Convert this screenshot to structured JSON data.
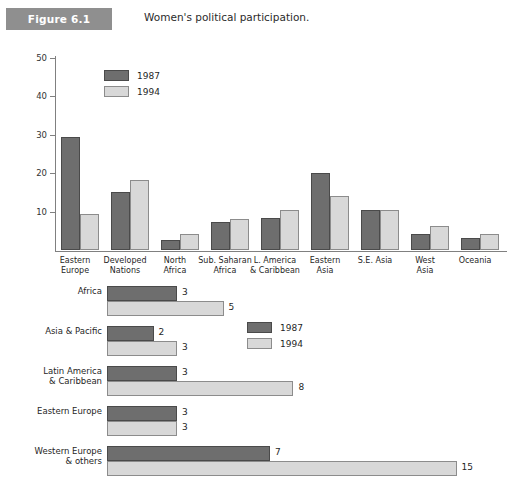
{
  "figure": {
    "badge": "Figure 6.1",
    "title": "Women's political participation."
  },
  "legend": {
    "series1": "1987",
    "series2": "1994"
  },
  "colors": {
    "series1": "#6e6e6e",
    "series2": "#d8d8d8",
    "badge": "#8f8f8f",
    "axis": "#808080"
  },
  "chart_data": [
    {
      "type": "bar",
      "orientation": "vertical",
      "title": "Women's political participation.",
      "xlabel": "",
      "ylabel": "",
      "ylim": [
        0,
        50
      ],
      "yticks": [
        10,
        20,
        30,
        40,
        50
      ],
      "grid": false,
      "legend_position": "top-left-inside",
      "categories": [
        "Eastern Europe",
        "Developed Nations",
        "North Africa",
        "Sub. Saharan Africa",
        "L. America & Caribbean",
        "Eastern Asia",
        "S.E. Asia",
        "West Asia",
        "Oceania"
      ],
      "category_lines": [
        [
          "Eastern",
          "Europe"
        ],
        [
          "Developed",
          "Nations"
        ],
        [
          "North",
          "Africa"
        ],
        [
          "Sub. Saharan",
          "Africa"
        ],
        [
          "L. America",
          "& Caribbean"
        ],
        [
          "Eastern",
          "Asia"
        ],
        [
          "S.E. Asia",
          ""
        ],
        [
          "West",
          "Asia"
        ],
        [
          "Oceania",
          ""
        ]
      ],
      "series": [
        {
          "name": "1987",
          "values": [
            29.5,
            15.0,
            2.5,
            7.3,
            8.3,
            20.0,
            10.4,
            4.3,
            3.1
          ]
        },
        {
          "name": "1994",
          "values": [
            9.3,
            18.3,
            4.2,
            8.1,
            10.5,
            14.0,
            10.4,
            6.2,
            4.2
          ]
        }
      ]
    },
    {
      "type": "bar",
      "orientation": "horizontal",
      "title": "",
      "xlabel": "",
      "ylabel": "",
      "xlim": [
        0,
        15
      ],
      "grid": false,
      "legend_position": "top-right",
      "categories": [
        "Africa",
        "Asia & Pacific",
        "Latin America & Caribbean",
        "Eastern Europe",
        "Western Europe & others"
      ],
      "category_lines": [
        [
          "Africa",
          ""
        ],
        [
          "Asia & Pacific",
          ""
        ],
        [
          "Latin America",
          "& Caribbean"
        ],
        [
          "Eastern Europe",
          ""
        ],
        [
          "Western Europe",
          "& others"
        ]
      ],
      "series": [
        {
          "name": "1987",
          "values": [
            3,
            2,
            3,
            3,
            7
          ]
        },
        {
          "name": "1994",
          "values": [
            5,
            3,
            8,
            3,
            15
          ]
        }
      ],
      "data_labels": {
        "1987": [
          "3",
          "2",
          "3",
          "3",
          "7"
        ],
        "1994": [
          "5",
          "3",
          "8",
          "3",
          "15"
        ]
      }
    }
  ]
}
